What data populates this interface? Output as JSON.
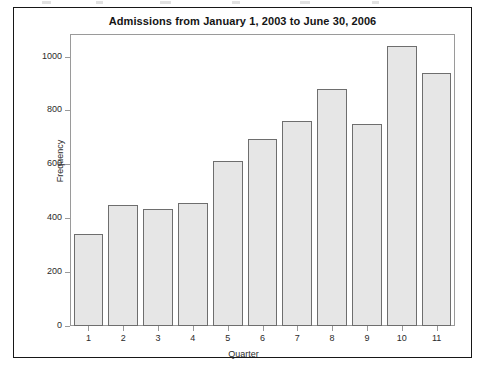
{
  "chart_data": {
    "type": "bar",
    "title": "Admissions from January 1, 2003 to June 30, 2006",
    "xlabel": "Quarter",
    "ylabel": "Frequency",
    "categories": [
      "1",
      "2",
      "3",
      "4",
      "5",
      "6",
      "7",
      "8",
      "9",
      "10",
      "11"
    ],
    "values": [
      340,
      450,
      433,
      457,
      612,
      693,
      760,
      878,
      748,
      1040,
      940
    ],
    "ylim": [
      0,
      1080
    ],
    "yticks": [
      0,
      200,
      400,
      600,
      800,
      1000
    ],
    "ytick_labels": [
      "0",
      "200",
      "400",
      "600",
      "800",
      "1000"
    ],
    "grid": false,
    "legend": false,
    "legend_position": "none",
    "bar_fill_color": "#e6e6e6",
    "bar_border_color": "#6e6e6e",
    "axis_color": "#9a9a9a",
    "text_color": "#2b2b2b",
    "frame_color": "#171717"
  }
}
